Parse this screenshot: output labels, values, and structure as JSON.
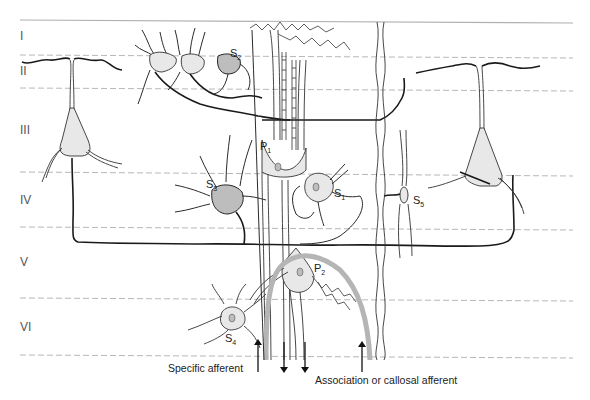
{
  "layers": [
    {
      "label": "I"
    },
    {
      "label": "II"
    },
    {
      "label": "III"
    },
    {
      "label": "IV"
    },
    {
      "label": "V"
    },
    {
      "label": "VI"
    }
  ],
  "cells": {
    "s1": {
      "base": "S",
      "sub": "1"
    },
    "s2": {
      "base": "S",
      "sub": "2"
    },
    "s3": {
      "base": "S",
      "sub": "3"
    },
    "s4": {
      "base": "S",
      "sub": "4"
    },
    "s5": {
      "base": "S",
      "sub": "5"
    },
    "p1": {
      "base": "P",
      "sub": "1"
    },
    "p2": {
      "base": "P",
      "sub": "2"
    }
  },
  "captions": {
    "specific_afferent": "Specific afferent",
    "association_afferent": "Association or callosal afferent"
  },
  "colors": {
    "line": "#1a1a1a",
    "layer_boundary": "#b8b8b8",
    "afferent_gray": "#b5b5b5",
    "soma_fill": "#e8e8e8"
  }
}
